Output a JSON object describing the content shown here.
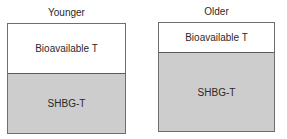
{
  "diagram": {
    "panels": [
      {
        "title": "Younger",
        "segments": [
          {
            "label": "Bioavailable T",
            "color": "#ffffff"
          },
          {
            "label": "SHBG-T",
            "color": "#cdcdcd"
          }
        ]
      },
      {
        "title": "Older",
        "segments": [
          {
            "label": "Bioavailable T",
            "color": "#ffffff"
          },
          {
            "label": "SHBG-T",
            "color": "#cdcdcd"
          }
        ]
      }
    ]
  }
}
